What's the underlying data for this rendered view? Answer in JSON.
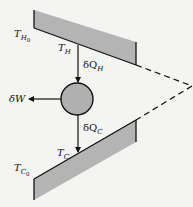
{
  "diagram": {
    "hot_reservoir": {
      "initial_label": {
        "main": "T",
        "sub": "H",
        "subsub": "0"
      },
      "current_label": {
        "main": "T",
        "sub": "H"
      }
    },
    "cold_reservoir": {
      "initial_label": {
        "main": "T",
        "sub": "C",
        "subsub": "0"
      },
      "current_label": {
        "main": "T",
        "sub": "C"
      }
    },
    "heat_in_label": {
      "main": "δQ",
      "sub": "H"
    },
    "heat_out_label": {
      "main": "δQ",
      "sub": "C"
    },
    "work_label": "δW",
    "colors": {
      "reservoir_fill": "#b4b4b4",
      "engine_fill": "#b0b0b0",
      "stroke": "#111111",
      "background": "#f4f4f2"
    }
  }
}
